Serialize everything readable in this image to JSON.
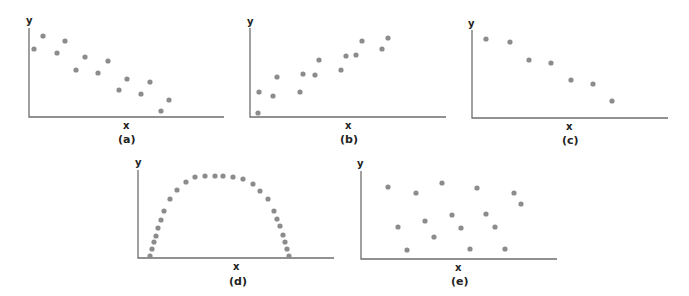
{
  "figure": {
    "panels": [
      {
        "id": "a",
        "caption": "(a)",
        "xlabel": "x",
        "ylabel": "y",
        "pattern": "negative linear correlation (scattered)"
      },
      {
        "id": "b",
        "caption": "(b)",
        "xlabel": "x",
        "ylabel": "y",
        "pattern": "positive linear correlation (scattered)"
      },
      {
        "id": "c",
        "caption": "(c)",
        "xlabel": "x",
        "ylabel": "y",
        "pattern": "strong negative linear correlation"
      },
      {
        "id": "d",
        "caption": "(d)",
        "xlabel": "x",
        "ylabel": "y",
        "pattern": "nonlinear (arch / inverted U)"
      },
      {
        "id": "e",
        "caption": "(e)",
        "xlabel": "x",
        "ylabel": "y",
        "pattern": "no correlation"
      }
    ],
    "colors": {
      "dot": "#8c8c8c",
      "axis": "#6e6e6e",
      "text": "#222222"
    }
  },
  "chart_data": [
    {
      "type": "scatter",
      "title": "(a)",
      "xlabel": "x",
      "ylabel": "y",
      "grid": false,
      "points": [
        [
          34,
          49
        ],
        [
          43,
          36
        ],
        [
          57,
          53
        ],
        [
          65,
          41
        ],
        [
          76,
          70
        ],
        [
          85,
          57
        ],
        [
          98,
          73
        ],
        [
          108,
          61
        ],
        [
          119,
          90
        ],
        [
          127,
          79
        ],
        [
          141,
          94
        ],
        [
          150,
          82
        ],
        [
          161,
          111
        ],
        [
          169,
          100
        ]
      ]
    },
    {
      "type": "scatter",
      "title": "(b)",
      "xlabel": "x",
      "ylabel": "y",
      "grid": false,
      "points": [
        [
          258,
          113
        ],
        [
          259,
          92
        ],
        [
          273,
          96
        ],
        [
          277,
          77
        ],
        [
          300,
          92
        ],
        [
          303,
          74
        ],
        [
          315,
          75
        ],
        [
          319,
          60
        ],
        [
          341,
          70
        ],
        [
          346,
          56
        ],
        [
          356,
          55
        ],
        [
          362,
          41
        ],
        [
          382,
          49
        ],
        [
          388,
          38
        ]
      ]
    },
    {
      "type": "scatter",
      "title": "(c)",
      "xlabel": "x",
      "ylabel": "y",
      "grid": false,
      "points": [
        [
          486,
          39
        ],
        [
          510,
          42
        ],
        [
          529,
          60
        ],
        [
          551,
          63
        ],
        [
          571,
          80
        ],
        [
          593,
          84
        ],
        [
          612,
          101
        ]
      ]
    },
    {
      "type": "scatter",
      "title": "(d)",
      "xlabel": "x",
      "ylabel": "y",
      "grid": false,
      "points": [
        [
          150,
          256
        ],
        [
          152,
          249
        ],
        [
          154,
          243
        ],
        [
          156,
          236
        ],
        [
          158,
          229
        ],
        [
          160,
          221
        ],
        [
          163,
          212
        ],
        [
          167,
          199
        ],
        [
          171,
          188
        ],
        [
          178,
          175
        ],
        [
          186,
          168
        ],
        [
          195,
          162
        ],
        [
          205,
          178
        ],
        [
          215,
          177
        ],
        [
          223,
          177
        ],
        [
          229,
          178
        ],
        [
          240,
          179
        ],
        [
          251,
          179
        ],
        [
          253,
          179
        ],
        [
          253,
          179
        ],
        [
          263,
          184
        ],
        [
          272,
          191
        ],
        [
          278,
          199
        ],
        [
          290,
          212
        ],
        [
          291,
          219
        ],
        [
          293,
          226
        ],
        [
          294,
          234
        ],
        [
          285,
          240
        ],
        [
          286,
          248
        ],
        [
          290,
          256
        ]
      ]
    },
    {
      "type": "scatter",
      "title": "(e)",
      "xlabel": "x",
      "ylabel": "y",
      "grid": false,
      "points": [
        [
          388,
          186
        ],
        [
          398,
          227
        ],
        [
          407,
          250
        ],
        [
          416,
          193
        ],
        [
          425,
          220
        ],
        [
          433,
          240
        ],
        [
          442,
          183
        ],
        [
          452,
          212
        ],
        [
          460,
          228
        ],
        [
          470,
          250
        ],
        [
          476,
          188
        ],
        [
          485,
          215
        ],
        [
          495,
          227
        ],
        [
          505,
          250
        ],
        [
          514,
          193
        ],
        [
          521,
          204
        ]
      ]
    }
  ]
}
